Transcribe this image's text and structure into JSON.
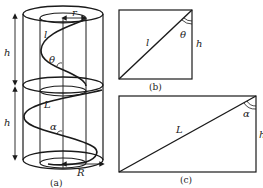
{
  "figure": {
    "panels": [
      {
        "id": "a",
        "caption": "(a)",
        "description": "Two stacked cylinders with helical paths; inner radius r, outer radius R",
        "labels": {
          "h_upper": "h",
          "h_lower": "h",
          "helix_upper": "l",
          "helix_lower": "L",
          "angle_upper": "θ",
          "angle_lower": "α",
          "radius_inner": "r",
          "radius_outer": "R"
        }
      },
      {
        "id": "b",
        "caption": "(b)",
        "description": "Unrolled upper helix: rectangle with diagonal l and height h",
        "labels": {
          "diagonal": "l",
          "angle": "θ",
          "side": "h"
        }
      },
      {
        "id": "c",
        "caption": "(c)",
        "description": "Unrolled lower helix: rectangle with diagonal L and height h",
        "labels": {
          "diagonal": "L",
          "angle": "α",
          "side": "h"
        }
      }
    ],
    "colors": {
      "stroke": "#1a1a1a",
      "background": "#ffffff"
    }
  }
}
